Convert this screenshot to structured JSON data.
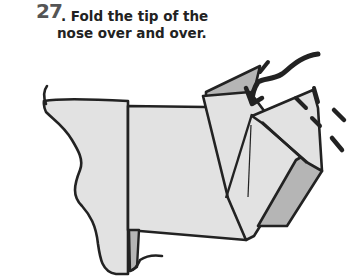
{
  "step": {
    "number": "27",
    "separator": ".",
    "instruction_line1": " Fold the tip of the",
    "instruction_line2": "nose over and over."
  },
  "colors": {
    "paper_front": "#e2e2e2",
    "paper_back": "#b5b5b5",
    "outline": "#222222",
    "step_number": "#555555"
  },
  "figure": {
    "action": "fold-arrow over nose tip"
  }
}
